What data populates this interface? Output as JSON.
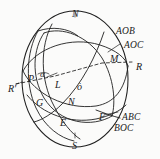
{
  "figure": {
    "kind": "spherical-geometry-diagram",
    "background_color": "#fbfbfa",
    "stroke_color": "#1f1f1f",
    "sphere": {
      "center_x": 75,
      "center_y": 79,
      "radius_x": 53,
      "radius_y": 68
    },
    "labels": [
      {
        "id": "north-pole",
        "text": "N",
        "x": 72,
        "y": 9,
        "style": "lbl"
      },
      {
        "id": "south-pole",
        "text": "S",
        "x": 72,
        "y": 141,
        "style": "lbl"
      },
      {
        "id": "point-aob",
        "text": "AOB",
        "x": 116,
        "y": 27,
        "style": "lbl grp"
      },
      {
        "id": "point-aoc",
        "text": "AOC",
        "x": 124,
        "y": 41,
        "style": "lbl grp"
      },
      {
        "id": "point-m",
        "text": "M",
        "x": 110,
        "y": 54,
        "style": "lbl"
      },
      {
        "id": "point-r",
        "text": "R",
        "x": 136,
        "y": 62,
        "style": "lbl"
      },
      {
        "id": "point-r-prime",
        "text": "R'",
        "x": 8,
        "y": 84,
        "style": "lbl"
      },
      {
        "id": "point-p",
        "text": "P",
        "x": 28,
        "y": 74,
        "style": "lbl"
      },
      {
        "id": "angle-alpha",
        "text": "α",
        "x": 40,
        "y": 70,
        "style": "lbl sm"
      },
      {
        "id": "point-l",
        "text": "L",
        "x": 55,
        "y": 80,
        "style": "lbl"
      },
      {
        "id": "center-o",
        "text": "ȯ",
        "x": 77,
        "y": 82,
        "style": "lbl"
      },
      {
        "id": "point-g",
        "text": "G",
        "x": 36,
        "y": 98,
        "style": "lbl"
      },
      {
        "id": "point-n-inner",
        "text": "N",
        "x": 68,
        "y": 97,
        "style": "lbl"
      },
      {
        "id": "point-e",
        "text": "E",
        "x": 60,
        "y": 118,
        "style": "lbl"
      },
      {
        "id": "point-f",
        "text": "F",
        "x": 99,
        "y": 112,
        "style": "lbl"
      },
      {
        "id": "point-abc",
        "text": "ABC",
        "x": 122,
        "y": 113,
        "style": "lbl grp"
      },
      {
        "id": "point-boc",
        "text": "BOC",
        "x": 114,
        "y": 124,
        "style": "lbl grp"
      }
    ]
  }
}
